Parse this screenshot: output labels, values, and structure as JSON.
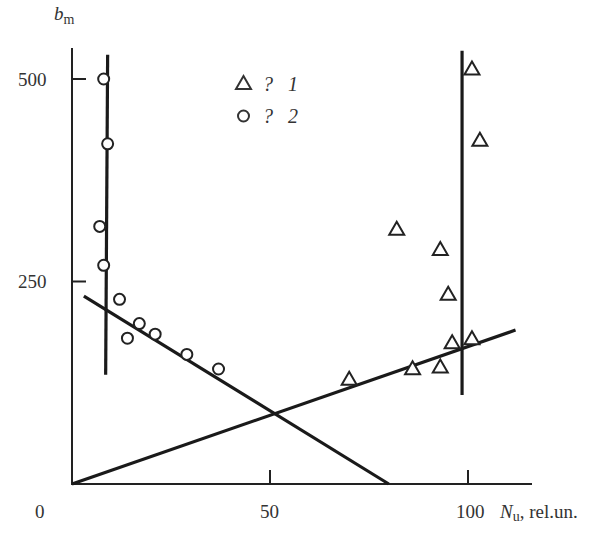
{
  "chart_data": {
    "type": "scatter",
    "title": "",
    "xlabel": "N_u, rel.un.",
    "xlabel_main": "N",
    "xlabel_sub": "u",
    "xlabel_unit": ", rel.un.",
    "ylabel": "b_m",
    "ylabel_main": "b",
    "ylabel_sub": "m",
    "xlim": [
      0,
      117
    ],
    "ylim": [
      0,
      530
    ],
    "x_ticks": [
      0,
      50,
      100
    ],
    "x_tick_labels": [
      "0",
      "50",
      "100"
    ],
    "y_ticks": [
      250,
      500
    ],
    "y_tick_labels": [
      "250",
      "500"
    ],
    "grid": false,
    "legend_position": "upper center",
    "legend": [
      {
        "marker": "triangle",
        "label_prefix": "?",
        "label": "1"
      },
      {
        "marker": "circle",
        "label_prefix": "?",
        "label": "2"
      }
    ],
    "series": [
      {
        "name": "? 1",
        "marker": "triangle",
        "points": [
          [
            70,
            130
          ],
          [
            82,
            315
          ],
          [
            86,
            143
          ],
          [
            93,
            290
          ],
          [
            93,
            145
          ],
          [
            95,
            235
          ],
          [
            96,
            175
          ],
          [
            101,
            513
          ],
          [
            101,
            180
          ],
          [
            103,
            425
          ]
        ]
      },
      {
        "name": "? 2",
        "marker": "circle",
        "points": [
          [
            8,
            500
          ],
          [
            9,
            420
          ],
          [
            7,
            318
          ],
          [
            8,
            270
          ],
          [
            12,
            228
          ],
          [
            14,
            180
          ],
          [
            17,
            198
          ],
          [
            21,
            185
          ],
          [
            29,
            160
          ],
          [
            37,
            142
          ]
        ]
      }
    ],
    "lines": [
      {
        "name": "vertical-line-series-2",
        "x1": 8.5,
        "y1": 135,
        "x2": 9,
        "y2": 530
      },
      {
        "name": "vertical-line-series-1",
        "x1": 98.5,
        "y1": 110,
        "x2": 98.5,
        "y2": 535
      },
      {
        "name": "decreasing-fit-line",
        "x1": 3,
        "y1": 232,
        "x2": 80,
        "y2": 0
      },
      {
        "name": "increasing-fit-line",
        "x1": 0,
        "y1": 0,
        "x2": 112,
        "y2": 190
      }
    ]
  }
}
